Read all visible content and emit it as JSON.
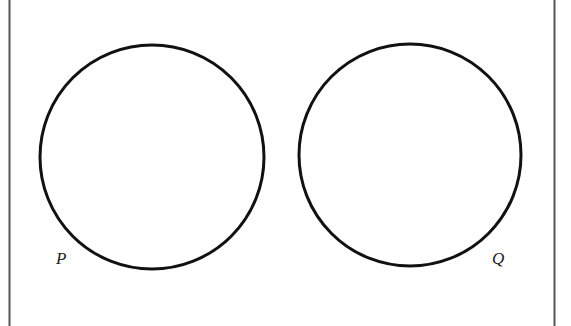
{
  "diagram": {
    "type": "venn",
    "universal_set": {
      "left_border_x": 9,
      "right_border_x": 554,
      "stroke": "#555555"
    },
    "sets": [
      {
        "label": "P",
        "cx": 152,
        "cy": 157,
        "r": 112,
        "label_x": 56,
        "label_y": 264
      },
      {
        "label": "Q",
        "cx": 410,
        "cy": 155,
        "r": 111,
        "label_x": 492,
        "label_y": 264
      }
    ],
    "stroke_color": "#111111",
    "background": "#ffffff"
  }
}
